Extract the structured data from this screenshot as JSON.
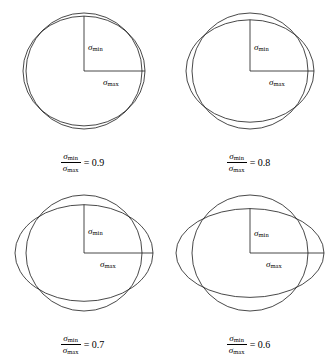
{
  "figure": {
    "title": "",
    "symbols": {
      "sigma": "σ",
      "min_subscript": "min",
      "max_subscript": "max",
      "equals": "="
    },
    "stroke_color": "#1a1a1a",
    "background_color": "#ffffff",
    "line_width": 0.8
  },
  "chart_data": {
    "type": "diagram",
    "xlabel": "",
    "ylabel": "",
    "panels": [
      {
        "id": "panel-0.9",
        "ratio_label": "0.9",
        "ratio_value": 0.9,
        "sigma_max": 61,
        "sigma_min": 54.9,
        "circle_radius": 58,
        "center_x": 84,
        "center_y": 71,
        "min_label": "σmin",
        "max_label": "σmax"
      },
      {
        "id": "panel-0.8",
        "ratio_label": "0.8",
        "ratio_value": 0.8,
        "sigma_max": 64,
        "sigma_min": 51.2,
        "circle_radius": 58,
        "center_x": 84,
        "center_y": 71,
        "min_label": "σmin",
        "max_label": "σmax"
      },
      {
        "id": "panel-0.7",
        "ratio_label": "0.7",
        "ratio_value": 0.7,
        "sigma_max": 69,
        "sigma_min": 48.3,
        "circle_radius": 58,
        "center_x": 84,
        "center_y": 71,
        "min_label": "σmin",
        "max_label": "σmax"
      },
      {
        "id": "panel-0.6",
        "ratio_label": "0.6",
        "ratio_value": 0.6,
        "sigma_max": 74,
        "sigma_min": 44.4,
        "circle_radius": 58,
        "center_x": 84,
        "center_y": 71,
        "min_label": "σmin",
        "max_label": "σmax"
      }
    ]
  },
  "panels": [
    {
      "ratio": "0.9",
      "min_label_sigma": "σ",
      "min_label_sub": "min",
      "max_label_sigma": "σ",
      "max_label_sub": "max",
      "caption_num_sigma": "σ",
      "caption_num_sub": "min",
      "caption_den_sigma": "σ",
      "caption_den_sub": "max",
      "caption_eq": "= 0.9"
    },
    {
      "ratio": "0.8",
      "min_label_sigma": "σ",
      "min_label_sub": "min",
      "max_label_sigma": "σ",
      "max_label_sub": "max",
      "caption_num_sigma": "σ",
      "caption_num_sub": "min",
      "caption_den_sigma": "σ",
      "caption_den_sub": "max",
      "caption_eq": "= 0.8"
    },
    {
      "ratio": "0.7",
      "min_label_sigma": "σ",
      "min_label_sub": "min",
      "max_label_sigma": "σ",
      "max_label_sub": "max",
      "caption_num_sigma": "σ",
      "caption_num_sub": "min",
      "caption_den_sigma": "σ",
      "caption_den_sub": "max",
      "caption_eq": "= 0.7"
    },
    {
      "ratio": "0.6",
      "min_label_sigma": "σ",
      "min_label_sub": "min",
      "max_label_sigma": "σ",
      "max_label_sub": "max",
      "caption_num_sigma": "σ",
      "caption_num_sub": "min",
      "caption_den_sigma": "σ",
      "caption_den_sub": "max",
      "caption_eq": "= 0.6"
    }
  ]
}
